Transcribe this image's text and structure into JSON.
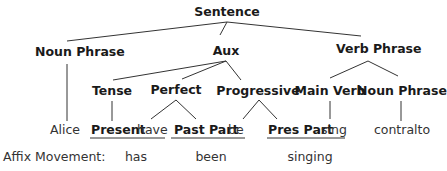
{
  "diagram": {
    "type": "syntax-tree",
    "root": "Sentence",
    "level1": [
      "Noun Phrase",
      "Aux",
      "Verb Phrase"
    ],
    "aux_children": [
      "Tense",
      "Perfect",
      "Progressive"
    ],
    "verb_phrase_children": [
      "Main Verb",
      "Noun Phrase"
    ],
    "leaves": {
      "subject": "Alice",
      "tense": "Present",
      "perfect_word": "have",
      "perfect_affix": "Past Part",
      "progressive_word": "be",
      "progressive_affix": "Pres Part",
      "main_verb": "sing",
      "object": "contralto"
    },
    "affix_movement": {
      "label": "Affix Movement:",
      "results": [
        "has",
        "been",
        "singing"
      ]
    }
  }
}
